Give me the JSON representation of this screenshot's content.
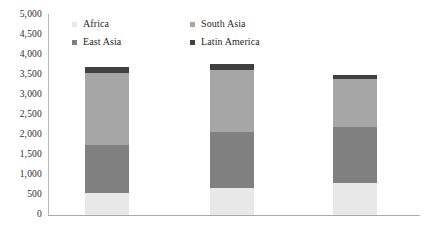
{
  "chart_data": {
    "type": "bar",
    "subtype": "stacked-bar",
    "title": "",
    "xlabel": "",
    "ylabel": "",
    "ylim": [
      0,
      5000
    ],
    "ytick_step": 500,
    "ytick_labels": [
      "5,000",
      "4,500",
      "4,000",
      "3,500",
      "3,000",
      "2,500",
      "2,000",
      "1,500",
      "1,000",
      "500",
      "0"
    ],
    "ytick_values": [
      5000,
      4500,
      4000,
      3500,
      3000,
      2500,
      2000,
      1500,
      1000,
      500,
      0
    ],
    "grid": false,
    "legend_position": "top-inside",
    "categories": [
      "Bar 1",
      "Bar 2",
      "Bar 3"
    ],
    "xtick_labels": [
      "",
      "",
      ""
    ],
    "stack_order": [
      "Africa",
      "East Asia",
      "South Asia",
      "Latin America"
    ],
    "series": [
      {
        "name": "Africa",
        "color": "#e8e8e8",
        "values": [
          550,
          680,
          800
        ]
      },
      {
        "name": "East Asia",
        "color": "#808080",
        "values": [
          1200,
          1400,
          1400
        ]
      },
      {
        "name": "South Asia",
        "color": "#a6a6a6",
        "values": [
          1800,
          1550,
          1200
        ]
      },
      {
        "name": "Latin America",
        "color": "#404040",
        "values": [
          150,
          150,
          100
        ]
      }
    ],
    "totals": [
      3700,
      3780,
      3500
    ]
  },
  "legend": {
    "items": [
      {
        "label": "Africa",
        "color": "#e8e8e8"
      },
      {
        "label": "South Asia",
        "color": "#a6a6a6"
      },
      {
        "label": "East Asia",
        "color": "#808080"
      },
      {
        "label": "Latin America",
        "color": "#404040"
      }
    ]
  },
  "axis_colors": {
    "y_axis_line": "#b9b9b9",
    "x_axis_line": "#a9a9a9",
    "tick_text": "#2b2b2b"
  }
}
